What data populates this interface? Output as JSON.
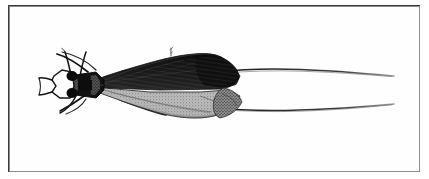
{
  "plate": {
    "background_color": "#ffffff",
    "frame_color": "#3a3a3c",
    "paper_color": "#fefefe",
    "frame": {
      "x": 8,
      "y": 5,
      "width": 412,
      "height": 167
    }
  },
  "figure": {
    "subject": "insect-specimen-dorsal-view",
    "orientation": "head-left",
    "ink_color": "#1a1a1a",
    "midtone_color": "#7b7b7b",
    "light_color": "#c9c9c9",
    "highlight_color": "#fbfbfb",
    "parts": [
      {
        "name": "head-capsule",
        "label": "head"
      },
      {
        "name": "labial-palps",
        "label": "palps"
      },
      {
        "name": "compound-eye-left",
        "label": "eye"
      },
      {
        "name": "compound-eye-right",
        "label": "eye"
      },
      {
        "name": "antenna-upper",
        "label": "antenna"
      },
      {
        "name": "antenna-lower",
        "label": "antenna"
      },
      {
        "name": "thorax",
        "label": "thorax"
      },
      {
        "name": "forewing-dark",
        "label": "forewing"
      },
      {
        "name": "hindwing-pale",
        "label": "hindwing"
      },
      {
        "name": "abdomen-tip",
        "label": "abdomen"
      },
      {
        "name": "foreleg",
        "label": "leg"
      },
      {
        "name": "midleg",
        "label": "leg"
      },
      {
        "name": "hindleg",
        "label": "leg"
      },
      {
        "name": "caudal-filament-upper",
        "label": "filament"
      },
      {
        "name": "caudal-filament-lower",
        "label": "filament"
      },
      {
        "name": "wing-seta-mark",
        "label": "seta"
      }
    ]
  }
}
